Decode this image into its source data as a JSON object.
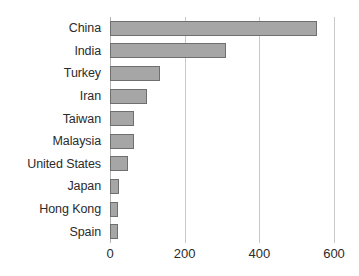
{
  "chart_data": {
    "type": "bar",
    "orientation": "horizontal",
    "title": "",
    "xlabel": "",
    "ylabel": "",
    "categories": [
      "China",
      "India",
      "Turkey",
      "Iran",
      "Taiwan",
      "Malaysia",
      "United States",
      "Japan",
      "Hong Kong",
      "Spain"
    ],
    "values": [
      555,
      312,
      133,
      100,
      65,
      65,
      48,
      25,
      22,
      22
    ],
    "xlim": [
      0,
      600
    ],
    "xticks": [
      0,
      200,
      400,
      600
    ],
    "xtick_labels": [
      "0",
      "200",
      "400",
      "600"
    ],
    "grid": "vertical",
    "legend": null,
    "series": [
      {
        "name": "",
        "values": [
          555,
          312,
          133,
          100,
          65,
          65,
          48,
          25,
          22,
          22
        ]
      }
    ],
    "colors": {
      "bar_fill": "#a6a6a6",
      "bar_border": "#6f6f6f",
      "gridline": "#c9c9c9",
      "axis": "#b3b3b3",
      "text": "#2b2b2b",
      "background": "#ffffff"
    }
  }
}
